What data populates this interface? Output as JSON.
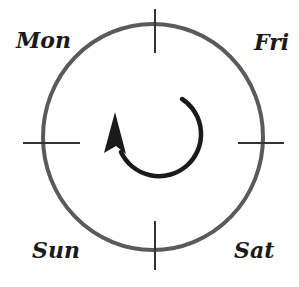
{
  "diagram": {
    "labels": {
      "top_left": "Mon",
      "top_right": "Fri",
      "bottom_left": "Sun",
      "bottom_right": "Sat"
    },
    "circle": {
      "cx": 153,
      "cy": 137,
      "rx": 110,
      "ry": 113,
      "stroke": "#555555",
      "stroke_width": 4
    },
    "ticks": [
      "top",
      "right",
      "bottom",
      "left"
    ],
    "rotation_arrow": {
      "direction": "clockwise",
      "color": "#1a1a1a"
    },
    "colors": {
      "circle": "#555555",
      "ticks": "#333333",
      "arrow": "#1a1a1a",
      "text": "#1a1a1a"
    }
  }
}
